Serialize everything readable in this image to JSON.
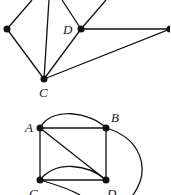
{
  "colors": {
    "ink": "#111111",
    "background": "#ffffff"
  },
  "top_graph": {
    "labels": {
      "D": "D",
      "C": "C"
    }
  },
  "bottom_graph": {
    "labels": {
      "A": "A",
      "B": "B",
      "C": "C",
      "D": "D"
    }
  }
}
